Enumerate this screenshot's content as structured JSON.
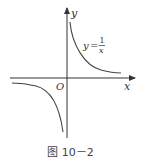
{
  "figure": {
    "caption": "图 10－2",
    "axes": {
      "x_label": "x",
      "y_label": "y",
      "origin_label": "O"
    },
    "function_label": {
      "lhs": "y",
      "equals": "=",
      "numerator": "1",
      "denominator": "x"
    },
    "function": "y = 1/x",
    "curve_type": "hyperbola",
    "colors": {
      "axis": "#333333",
      "curve": "#444444",
      "text": "#333333"
    }
  }
}
